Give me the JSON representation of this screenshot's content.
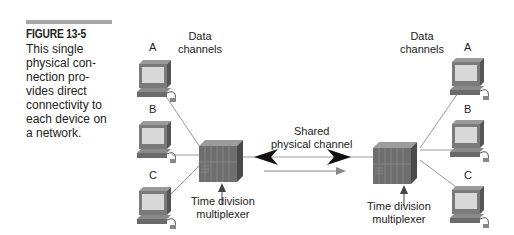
{
  "caption": {
    "figure_label": "FIGURE 13-5",
    "lines": [
      "This single",
      "physical con-",
      "nection pro-",
      "vides direct",
      "connectivity to",
      "each device on",
      "a network."
    ]
  },
  "left": {
    "channels_label_1": "Data",
    "channels_label_2": "channels",
    "devices": [
      "A",
      "B",
      "C"
    ],
    "mux_label_1": "Time division",
    "mux_label_2": "multiplexer"
  },
  "right": {
    "channels_label_1": "Data",
    "channels_label_2": "channels",
    "devices": [
      "A",
      "B",
      "C"
    ],
    "mux_label_1": "Time division",
    "mux_label_2": "multiplexer"
  },
  "link": {
    "label_1": "Shared",
    "label_2": "physical channel"
  }
}
